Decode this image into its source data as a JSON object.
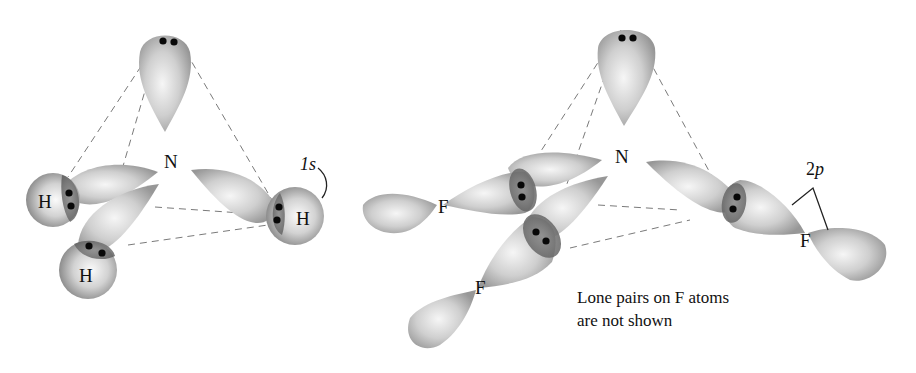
{
  "figure": {
    "left_molecule": {
      "name": "NH3",
      "central_atom": "N",
      "atoms": [
        "H",
        "H",
        "H"
      ],
      "orbital_label": "1s"
    },
    "right_molecule": {
      "name": "NF3",
      "central_atom": "N",
      "atoms": [
        "F",
        "F",
        "F"
      ],
      "orbital_label_prefix": "2",
      "orbital_label_suffix": "p",
      "note_line1": "Lone pairs on F atoms",
      "note_line2": "are not shown"
    },
    "colors": {
      "orbital_light": "#f4f4f4",
      "orbital_mid": "#c8c8c8",
      "orbital_dark": "#8f8f8f",
      "overlap": "#6e6e6e",
      "electron": "#080808"
    }
  }
}
